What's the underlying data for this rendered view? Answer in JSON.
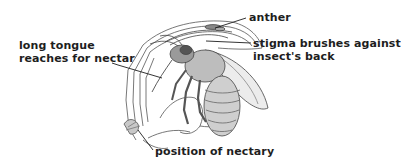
{
  "diagram": {
    "labels": {
      "tongue": {
        "line1": "long tongue",
        "line2": "reaches for nectar"
      },
      "anther": "anther",
      "stigma": {
        "line1": "stigma brushes against",
        "line2": "insect's back"
      },
      "nectary": "position of nectary"
    },
    "colors": {
      "ink": "#1e1e1e",
      "drawing_line": "#555555",
      "shading": "#9a9a9a",
      "background": "#ffffff"
    }
  }
}
